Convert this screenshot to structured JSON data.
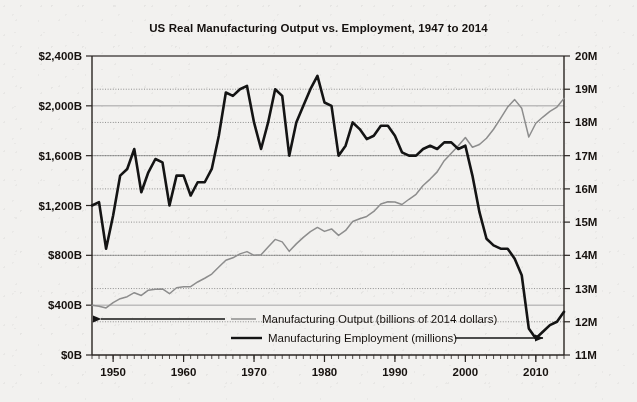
{
  "chart_data": {
    "type": "line",
    "title": "US Real Manufacturing Output vs. Employment, 1947 to 2014",
    "xlabel": "",
    "ylabel": "",
    "grid": true,
    "legend_position": "inside-bottom-left",
    "x": [
      1947,
      1948,
      1949,
      1950,
      1951,
      1952,
      1953,
      1954,
      1955,
      1956,
      1957,
      1958,
      1959,
      1960,
      1961,
      1962,
      1963,
      1964,
      1965,
      1966,
      1967,
      1968,
      1969,
      1970,
      1971,
      1972,
      1973,
      1974,
      1975,
      1976,
      1977,
      1978,
      1979,
      1980,
      1981,
      1982,
      1983,
      1984,
      1985,
      1986,
      1987,
      1988,
      1989,
      1990,
      1991,
      1992,
      1993,
      1994,
      1995,
      1996,
      1997,
      1998,
      1999,
      2000,
      2001,
      2002,
      2003,
      2004,
      2005,
      2006,
      2007,
      2008,
      2009,
      2010,
      2011,
      2012,
      2013,
      2014
    ],
    "axes": {
      "left": {
        "label": "Manufacturing Output (billions of 2014 dollars)",
        "ticks": [
          "$0B",
          "$400B",
          "$800B",
          "$1,200B",
          "$1,600B",
          "$2,000B",
          "$2,400B"
        ],
        "min": 0,
        "max": 2400,
        "step": 400,
        "gridline_style": "solid"
      },
      "right": {
        "label": "Manufacturing Employment (millions)",
        "ticks": [
          "11M",
          "12M",
          "13M",
          "14M",
          "15M",
          "16M",
          "17M",
          "18M",
          "19M",
          "20M"
        ],
        "min": 11,
        "max": 20,
        "step": 1,
        "gridline_style": "dotted"
      },
      "bottom": {
        "ticks": [
          "1950",
          "1960",
          "1970",
          "1980",
          "1990",
          "2000",
          "2010"
        ],
        "tick_values": [
          1950,
          1960,
          1970,
          1980,
          1990,
          2000,
          2010
        ],
        "min": 1947,
        "max": 2014,
        "minor_tick_interval": 1
      }
    },
    "series": [
      {
        "name": "Manufacturing Output (billions of 2014 dollars)",
        "axis": "left",
        "units": "billions of 2014 dollars",
        "color": "#8d8d8d",
        "arrow_direction": "left",
        "values": [
          400,
          392,
          378,
          420,
          452,
          468,
          500,
          478,
          520,
          528,
          530,
          492,
          540,
          548,
          548,
          586,
          616,
          650,
          706,
          760,
          780,
          812,
          830,
          800,
          805,
          866,
          928,
          908,
          832,
          892,
          944,
          990,
          1024,
          992,
          1012,
          960,
          1000,
          1072,
          1094,
          1112,
          1152,
          1212,
          1230,
          1228,
          1208,
          1250,
          1290,
          1360,
          1412,
          1470,
          1560,
          1620,
          1680,
          1746,
          1668,
          1690,
          1740,
          1812,
          1900,
          1990,
          2050,
          1980,
          1750,
          1860,
          1910,
          1955,
          1990,
          2060
        ]
      },
      {
        "name": "Manufacturing Employment (millions)",
        "axis": "right",
        "units": "millions",
        "color": "#141414",
        "arrow_direction": "right",
        "values": [
          15.5,
          15.6,
          14.2,
          15.2,
          16.4,
          16.6,
          17.2,
          15.9,
          16.5,
          16.9,
          16.8,
          15.5,
          16.4,
          16.4,
          15.8,
          16.2,
          16.2,
          16.6,
          17.6,
          18.9,
          18.8,
          19.0,
          19.1,
          18.0,
          17.2,
          18.0,
          19.0,
          18.8,
          17.0,
          18.0,
          18.5,
          19.0,
          19.4,
          18.6,
          18.5,
          17.0,
          17.3,
          18.0,
          17.8,
          17.5,
          17.6,
          17.9,
          17.9,
          17.6,
          17.1,
          17.0,
          17.0,
          17.2,
          17.3,
          17.2,
          17.4,
          17.4,
          17.2,
          17.3,
          16.4,
          15.3,
          14.5,
          14.3,
          14.2,
          14.2,
          13.9,
          13.4,
          11.8,
          11.5,
          11.7,
          11.9,
          12.0,
          12.3
        ]
      }
    ],
    "annotations": []
  },
  "legend": {
    "items": [
      {
        "label": "Manufacturing Output (billions of 2014 dollars)",
        "arrow": "left-arrow-icon",
        "swatch": "thin-gray-line"
      },
      {
        "label": "Manufacturing Employment (millions)",
        "arrow": "right-arrow-icon",
        "swatch": "thick-black-line"
      }
    ]
  },
  "colors": {
    "output_line": "#8d8d8d",
    "employment_line": "#141414",
    "axis": "#2a2522",
    "grid_solid": "#9a9a9a",
    "grid_dotted": "#6f6f6f",
    "paper": "#f2f1ef",
    "text": "#17120f"
  }
}
